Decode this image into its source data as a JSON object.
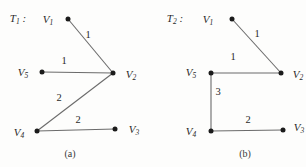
{
  "figure": {
    "width": 306,
    "height": 167,
    "background_color": "#fdfdfc",
    "ink_color": "#2a2a2a",
    "edge_color": "#6b6b6b",
    "node_color": "#1b1b1b"
  },
  "panels": [
    {
      "id": "a",
      "caption": "(a)",
      "caption_pos": {
        "x": 70,
        "y": 153
      },
      "title": "T",
      "title_sub": "1",
      "title_suffix": " :",
      "title_pos": {
        "x": 18,
        "y": 18
      },
      "nodes": [
        {
          "id": "V1",
          "label": "V",
          "sub": "1",
          "x": 68,
          "y": 19,
          "label_x": 48,
          "label_y": 19
        },
        {
          "id": "V2",
          "label": "V",
          "sub": "2",
          "x": 113,
          "y": 73,
          "label_x": 131,
          "label_y": 74
        },
        {
          "id": "V3",
          "label": "V",
          "sub": "3",
          "x": 115,
          "y": 129,
          "label_x": 134,
          "label_y": 129
        },
        {
          "id": "V4",
          "label": "V",
          "sub": "4",
          "x": 37,
          "y": 131,
          "label_x": 19,
          "label_y": 132
        },
        {
          "id": "V5",
          "label": "V",
          "sub": "5",
          "x": 42,
          "y": 72,
          "label_x": 23,
          "label_y": 72
        }
      ],
      "edges": [
        {
          "from": "V1",
          "to": "V2",
          "weight": "1",
          "label_x": 88,
          "label_y": 34
        },
        {
          "from": "V5",
          "to": "V2",
          "weight": "1",
          "label_x": 64,
          "label_y": 60
        },
        {
          "from": "V4",
          "to": "V2",
          "weight": "2",
          "label_x": 59,
          "label_y": 97
        },
        {
          "from": "V4",
          "to": "V3",
          "weight": "2",
          "label_x": 78,
          "label_y": 119
        }
      ]
    },
    {
      "id": "b",
      "caption": "(b)",
      "caption_pos": {
        "x": 92,
        "y": 153
      },
      "title": "T",
      "title_sub": "2",
      "title_suffix": " :",
      "title_pos": {
        "x": 22,
        "y": 18
      },
      "nodes": [
        {
          "id": "V1",
          "label": "V",
          "sub": "1",
          "x": 79,
          "y": 19,
          "label_x": 55,
          "label_y": 19
        },
        {
          "id": "V2",
          "label": "V",
          "sub": "2",
          "x": 128,
          "y": 73,
          "label_x": 145,
          "label_y": 74
        },
        {
          "id": "V3",
          "label": "V",
          "sub": "3",
          "x": 130,
          "y": 130,
          "label_x": 146,
          "label_y": 127
        },
        {
          "id": "V4",
          "label": "V",
          "sub": "4",
          "x": 58,
          "y": 131,
          "label_x": 38,
          "label_y": 131
        },
        {
          "id": "V5",
          "label": "V",
          "sub": "5",
          "x": 58,
          "y": 73,
          "label_x": 38,
          "label_y": 72
        }
      ],
      "edges": [
        {
          "from": "V1",
          "to": "V2",
          "weight": "1",
          "label_x": 104,
          "label_y": 33
        },
        {
          "from": "V5",
          "to": "V2",
          "weight": "1",
          "label_x": 80,
          "label_y": 56
        },
        {
          "from": "V5",
          "to": "V4",
          "weight": "3",
          "label_x": 65,
          "label_y": 91
        },
        {
          "from": "V4",
          "to": "V3",
          "weight": "2",
          "label_x": 95,
          "label_y": 119
        }
      ]
    }
  ]
}
